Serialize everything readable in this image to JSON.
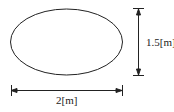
{
  "diagram": {
    "shape": "ellipse",
    "stroke_color": "#222222",
    "height_label": "1.5[m]",
    "width_label": "2[m]"
  }
}
